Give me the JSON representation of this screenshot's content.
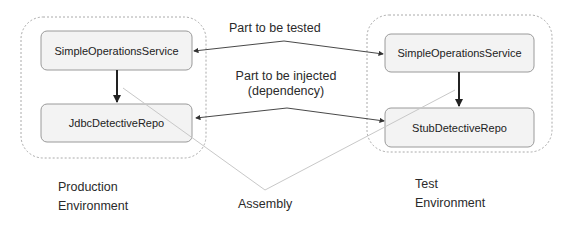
{
  "diagram": {
    "environments": [
      {
        "id": "production",
        "label_line1": "Production",
        "label_line2": "Environment",
        "components": [
          "SimpleOperationsService",
          "JdbcDetectiveRepo"
        ]
      },
      {
        "id": "test",
        "label_line1": "Test",
        "label_line2": "Environment",
        "components": [
          "SimpleOperationsService",
          "StubDetectiveRepo"
        ]
      }
    ],
    "connectors": {
      "tested_label": "Part to be tested",
      "injected_label_line1": "Part to be injected",
      "injected_label_line2": "(dependency)",
      "assembly_label": "Assembly"
    },
    "colors": {
      "box_fill": "#f3f3f3",
      "box_border": "#9a9a9a",
      "container_border": "#aaaaaa",
      "arrow": "#333333",
      "assembly_line": "#c8c8c8"
    }
  }
}
